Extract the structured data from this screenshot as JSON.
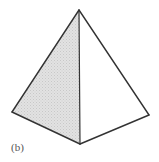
{
  "figure": {
    "label": "(b)",
    "colors": {
      "stroke": "#333333",
      "shade": "#e2e2e2",
      "shade_dot": "#c8c8c8",
      "background": "#ffffff"
    },
    "vertices": {
      "apex": [
        79,
        10
      ],
      "left": [
        12,
        112
      ],
      "bottom": [
        80,
        144
      ],
      "right": [
        149,
        115
      ]
    },
    "faces": [
      {
        "name": "left-face",
        "shaded": true
      },
      {
        "name": "right-face",
        "shaded": false
      }
    ]
  }
}
